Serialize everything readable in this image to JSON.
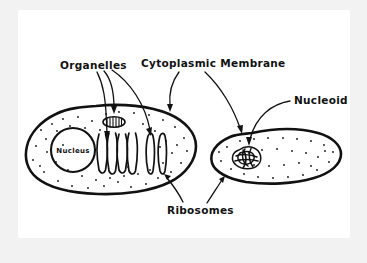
{
  "figure": {
    "kind": "hand-drawn-biology-diagram",
    "background_color": "#f2f2f2",
    "paper_color": "#ffffff",
    "ink_color": "#111111",
    "title": ""
  },
  "labels": {
    "organelles": "Organelles",
    "cytoplasmic_membrane": "Cytoplasmic Membrane",
    "nucleoid": "Nucleoid",
    "nucleus": "Nucleus",
    "ribosomes": "Ribosomes"
  },
  "cells": {
    "eukaryotic": {
      "name": "eukaryotic-cell",
      "structures": [
        "nucleus",
        "mitochondrion",
        "endoplasmic-reticulum",
        "golgi-apparatus",
        "ribosomes",
        "cytoplasmic-membrane"
      ]
    },
    "prokaryotic": {
      "name": "prokaryotic-cell",
      "structures": [
        "nucleoid",
        "ribosomes",
        "cytoplasmic-membrane"
      ]
    }
  },
  "annotations": {
    "organelles_arrow_count": 3,
    "cytoplasmic_membrane_arrow_count": 2,
    "nucleoid_arrow_count": 1,
    "ribosomes_arrow_count": 2
  }
}
